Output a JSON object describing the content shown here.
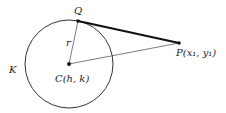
{
  "diagram": {
    "circle": {
      "label": "K",
      "cx": 69,
      "cy": 64,
      "r": 44
    },
    "points": {
      "center": {
        "label": "C(h, k)",
        "x": 69,
        "y": 64
      },
      "tangent_point": {
        "label": "Q",
        "x": 78,
        "y": 21
      },
      "external_point": {
        "label": "P(x₁, y₁)",
        "x": 179,
        "y": 43
      }
    },
    "segments": {
      "radius_label": "r"
    },
    "colors": {
      "stroke": "#222222",
      "background": "#ffffff"
    }
  }
}
